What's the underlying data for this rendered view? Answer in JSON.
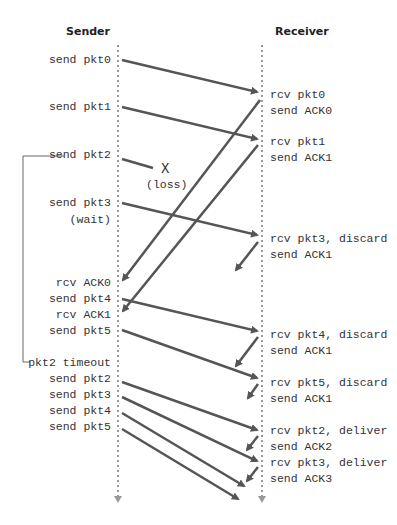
{
  "diagram": {
    "type": "sequence",
    "title_left": "Sender",
    "title_right": "Receiver",
    "colors": {
      "arrow": "#555555",
      "lifeline": "#9a9a9a",
      "bracket": "#666666"
    },
    "sender_events": [
      {
        "label": "send pkt0",
        "y": 60
      },
      {
        "label": "send pkt1",
        "y": 107
      },
      {
        "label": "send pkt2",
        "y": 154
      },
      {
        "label": "send pkt3",
        "y": 202
      },
      {
        "label": "(wait)",
        "y": 219
      },
      {
        "label": "rcv ACK0",
        "y": 282
      },
      {
        "label": "send pkt4",
        "y": 298
      },
      {
        "label": "rcv ACK1",
        "y": 314
      },
      {
        "label": "send pkt5",
        "y": 330
      },
      {
        "label": "pkt2 timeout",
        "y": 362
      },
      {
        "label": "send pkt2",
        "y": 378
      },
      {
        "label": "send pkt3",
        "y": 394
      },
      {
        "label": "send pkt4",
        "y": 410
      },
      {
        "label": "send pkt5",
        "y": 426
      }
    ],
    "receiver_events": [
      {
        "label": "rcv pkt0",
        "y": 94
      },
      {
        "label": "send ACK0",
        "y": 110
      },
      {
        "label": "rcv pkt1",
        "y": 141
      },
      {
        "label": "send ACK1",
        "y": 157
      },
      {
        "label": "rcv pkt3, discard",
        "y": 238
      },
      {
        "label": "send ACK1",
        "y": 254
      },
      {
        "label": "rcv pkt4, discard",
        "y": 334
      },
      {
        "label": "send ACK1",
        "y": 350
      },
      {
        "label": "rcv pkt5, discard",
        "y": 382
      },
      {
        "label": "send ACK1",
        "y": 398
      },
      {
        "label": "rcv pkt2, deliver",
        "y": 430
      },
      {
        "label": "send ACK2",
        "y": 446
      },
      {
        "label": "rcv pkt3, deliver",
        "y": 462
      },
      {
        "label": "send ACK3",
        "y": 478
      }
    ],
    "loss": {
      "mark": "X",
      "label": "(loss)"
    }
  }
}
